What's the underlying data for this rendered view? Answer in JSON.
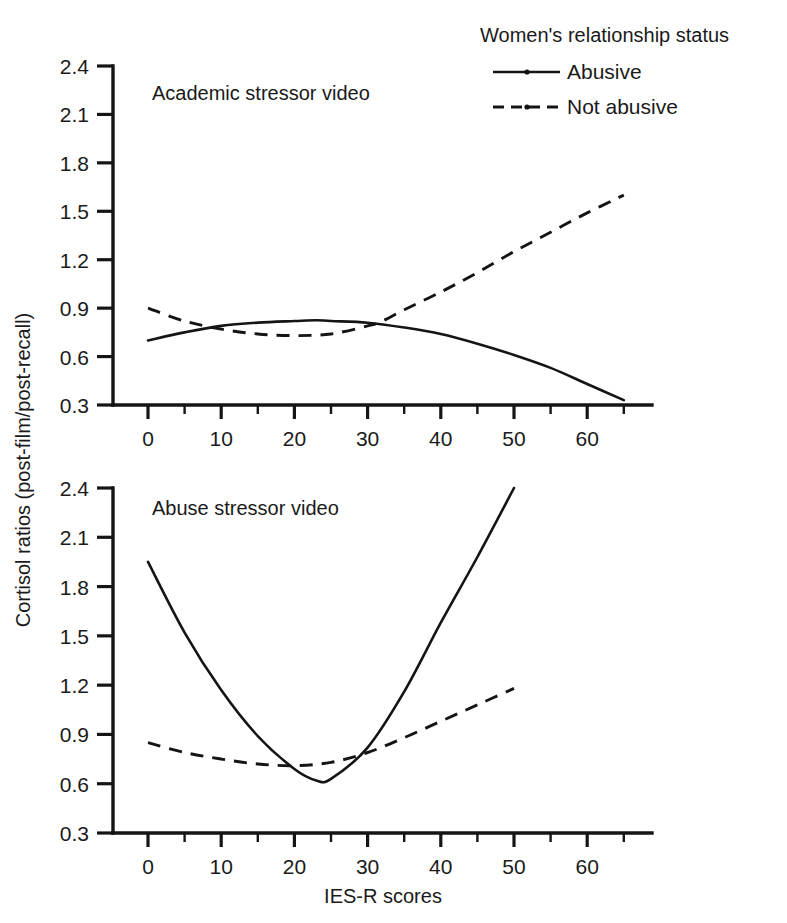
{
  "figure": {
    "background": "#ffffff",
    "ink_color": "#141414",
    "y_axis_title": "Cortisol ratios (post-film/post-recall)",
    "x_axis_title": "IES-R scores"
  },
  "legend": {
    "title": "Women's relationship status",
    "entries": [
      {
        "label": "Abusive",
        "style": "solid",
        "marker": "dot"
      },
      {
        "label": "Not abusive",
        "style": "dashed",
        "marker": "dot"
      }
    ]
  },
  "chart_data": [
    {
      "type": "line",
      "panel": "top",
      "title": "Academic stressor video",
      "xlabel": "IES-R scores",
      "ylabel": "Cortisol ratios (post-film/post-recall)",
      "xlim": [
        -2,
        68
      ],
      "ylim": [
        0.3,
        2.4
      ],
      "xticks": [
        0,
        10,
        20,
        30,
        40,
        50,
        60
      ],
      "xminor_step": 5,
      "yticks": [
        0.3,
        0.6,
        0.9,
        1.2,
        1.5,
        1.8,
        2.1,
        2.4
      ],
      "grid": false,
      "legend_position": "top-right-outside",
      "series": [
        {
          "name": "Abusive",
          "style": "solid",
          "x": [
            0,
            5,
            10,
            15,
            20,
            23,
            25,
            30,
            35,
            40,
            45,
            50,
            55,
            60,
            65
          ],
          "values": [
            0.7,
            0.75,
            0.79,
            0.81,
            0.82,
            0.825,
            0.82,
            0.81,
            0.78,
            0.74,
            0.68,
            0.61,
            0.53,
            0.43,
            0.33
          ]
        },
        {
          "name": "Not abusive",
          "style": "dashed",
          "x": [
            0,
            5,
            10,
            15,
            20,
            25,
            30,
            32,
            35,
            40,
            45,
            50,
            55,
            60,
            65
          ],
          "values": [
            0.9,
            0.82,
            0.77,
            0.74,
            0.73,
            0.74,
            0.79,
            0.82,
            0.89,
            1.0,
            1.12,
            1.25,
            1.37,
            1.49,
            1.6
          ]
        }
      ]
    },
    {
      "type": "line",
      "panel": "bottom",
      "title": "Abuse stressor video",
      "xlabel": "IES-R scores",
      "ylabel": "Cortisol ratios (post-film/post-recall)",
      "xlim": [
        -2,
        68
      ],
      "ylim": [
        0.3,
        2.4
      ],
      "xticks": [
        0,
        10,
        20,
        30,
        40,
        50,
        60
      ],
      "xminor_step": 5,
      "yticks": [
        0.3,
        0.6,
        0.9,
        1.2,
        1.5,
        1.8,
        2.1,
        2.4
      ],
      "grid": false,
      "legend_position": "top-right-outside",
      "series": [
        {
          "name": "Abusive",
          "style": "solid",
          "x": [
            0,
            5,
            10,
            15,
            20,
            23,
            25,
            30,
            35,
            40,
            45,
            50
          ],
          "values": [
            1.95,
            1.52,
            1.17,
            0.89,
            0.69,
            0.62,
            0.63,
            0.82,
            1.16,
            1.58,
            1.98,
            2.4
          ]
        },
        {
          "name": "Not abusive",
          "style": "dashed",
          "x": [
            0,
            5,
            10,
            15,
            20,
            25,
            30,
            35,
            40,
            45,
            50
          ],
          "values": [
            0.85,
            0.79,
            0.75,
            0.72,
            0.71,
            0.73,
            0.79,
            0.88,
            0.98,
            1.08,
            1.18
          ]
        }
      ]
    }
  ]
}
